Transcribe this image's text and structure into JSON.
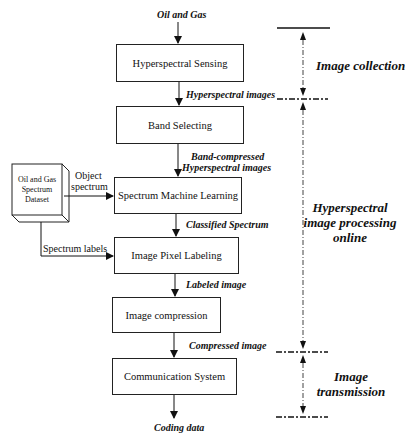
{
  "diagram": {
    "input_label": "Oil and Gas",
    "output_label": "Coding data",
    "process_boxes": [
      {
        "id": "hyperspectral-sensing",
        "label": "Hyperspectral Sensing"
      },
      {
        "id": "band-selecting",
        "label": "Band Selecting"
      },
      {
        "id": "spectrum-machine-learning",
        "label": "Spectrum Machine Learning"
      },
      {
        "id": "image-pixel-labeling",
        "label": "Image Pixel Labeling"
      },
      {
        "id": "image-compression",
        "label": "Image compression"
      },
      {
        "id": "communication-system",
        "label": "Communication System"
      }
    ],
    "edge_labels": {
      "sensing_to_band": "Hyperspectral images",
      "band_to_ml_line1": "Band-compressed",
      "band_to_ml_line2": "Hyperspectral images",
      "ml_to_labeling": "Classified Spectrum",
      "labeling_to_compression": "Labeled image",
      "compression_to_comm": "Compressed image"
    },
    "dataset": {
      "line1": "Oil and Gas",
      "line2": "Spectrum",
      "line3": "Dataset",
      "object_spectrum_line1": "Object",
      "object_spectrum_line2": "spectrum",
      "spectrum_labels": "Spectrum labels"
    },
    "stages": {
      "collection": "Image collection",
      "processing_line1": "Hyperspectral",
      "processing_line2": "image processing",
      "processing_line3": "online",
      "transmission_line1": "Image",
      "transmission_line2": "transmission"
    }
  }
}
